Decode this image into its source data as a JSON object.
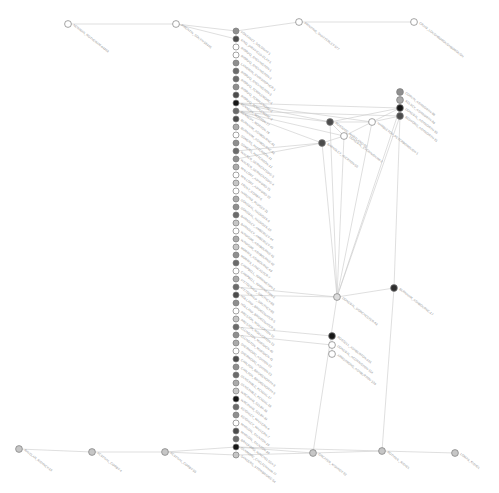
{
  "figure": {
    "title": "",
    "type": "network-graph",
    "width": 499,
    "height": 493,
    "background": "#ffffff"
  },
  "style": {
    "edge_color": "#c9c9c9",
    "node_stroke": "#7d7d7d",
    "label_color": "#8b8b8b",
    "label_angle_deg": 38,
    "node_radius": 3.0,
    "hub_radius": 3.4
  },
  "palette": {
    "black": "#171717",
    "darkest": "#2e2e2e",
    "dark": "#4c4c4c",
    "mid_dark": "#6b6b6b",
    "mid": "#8f8f8f",
    "mid_light": "#ababab",
    "light": "#c6c6c6",
    "lighter": "#dcdcdc",
    "white": "#ffffff"
  },
  "graph_data": {
    "nodes": [
      {
        "id": "n_top_1",
        "label": "NEWMAN_ROTHERAM-64303",
        "x": 68,
        "y": 24,
        "fill": "#ffffff"
      },
      {
        "id": "n_top_2",
        "label": "FIRENTIN_SOUTH-59445",
        "x": 176,
        "y": 24,
        "fill": "#ffffff"
      },
      {
        "id": "n_top_3",
        "label": "PRINTING_SHATTERLEY-577",
        "x": 299,
        "y": 22,
        "fill": "#ffffff"
      },
      {
        "id": "n_top_4",
        "label": "CRAIG_LOUGHBOROUGHBOROUGH",
        "x": 414,
        "y": 22,
        "fill": "#ffffff"
      },
      {
        "id": "c01",
        "label": "FONTANET_SOLOWAY-1",
        "x": 236,
        "y": 31,
        "fill": "#8f8f8f"
      },
      {
        "id": "c02",
        "label": "KING_DRIFFIELD-CLAY-1",
        "x": 236,
        "y": 39,
        "fill": "#4c4c4c"
      },
      {
        "id": "c03",
        "label": "RIORDO_SHEVINGTON-1",
        "x": 236,
        "y": 47,
        "fill": "#ffffff"
      },
      {
        "id": "c04",
        "label": "RIORDO_SHEVINGTON-2",
        "x": 236,
        "y": 55,
        "fill": "#ffffff"
      },
      {
        "id": "c05",
        "label": "LANGMAN_CHRISTOPHER-1",
        "x": 236,
        "y": 63,
        "fill": "#8f8f8f"
      },
      {
        "id": "c06",
        "label": "RIORDO_SHEVINGTON-3",
        "x": 236,
        "y": 71,
        "fill": "#6b6b6b"
      },
      {
        "id": "c07",
        "label": "RIORDO_TEMPLEMORE-1",
        "x": 236,
        "y": 79,
        "fill": "#6b6b6b"
      },
      {
        "id": "c08",
        "label": "RIORDO_TEMPLEMORE-2",
        "x": 236,
        "y": 87,
        "fill": "#8f8f8f"
      },
      {
        "id": "c09",
        "label": "RIORDO_TEMPLEMORE-3",
        "x": 236,
        "y": 95,
        "fill": "#4c4c4c"
      },
      {
        "id": "c10",
        "label": "KENNEDY_MORTON-77",
        "x": 236,
        "y": 103,
        "fill": "#171717"
      },
      {
        "id": "c11",
        "label": "KENNEDY_MORTON-78",
        "x": 236,
        "y": 111,
        "fill": "#6b6b6b"
      },
      {
        "id": "c12",
        "label": "BURNHAM_ASHBOURNE-91",
        "x": 236,
        "y": 119,
        "fill": "#4c4c4c"
      },
      {
        "id": "c13",
        "label": "BURNHAM_ASHBOURNE-92",
        "x": 236,
        "y": 127,
        "fill": "#ababab"
      },
      {
        "id": "c14",
        "label": "SOMERS_PATTERSON-11",
        "x": 236,
        "y": 135,
        "fill": "#ffffff"
      },
      {
        "id": "c15",
        "label": "SOMERS_PATTERSON-12",
        "x": 236,
        "y": 143,
        "fill": "#8f8f8f"
      },
      {
        "id": "c16",
        "label": "WALKER_DERWENTSIDE-3",
        "x": 236,
        "y": 151,
        "fill": "#6b6b6b"
      },
      {
        "id": "c17",
        "label": "WALKER_DERWENTSIDE-4",
        "x": 236,
        "y": 159,
        "fill": "#8f8f8f"
      },
      {
        "id": "c18",
        "label": "MALLORY_ASHFORD-21",
        "x": 236,
        "y": 167,
        "fill": "#ababab"
      },
      {
        "id": "c19",
        "label": "MALLORY_ASHFORD-22",
        "x": 236,
        "y": 175,
        "fill": "#ffffff"
      },
      {
        "id": "c20",
        "label": "TRENT_CORBY-5",
        "x": 236,
        "y": 183,
        "fill": "#c6c6c6"
      },
      {
        "id": "c21",
        "label": "HARDING_PUDSEY-31",
        "x": 236,
        "y": 191,
        "fill": "#ffffff"
      },
      {
        "id": "c22",
        "label": "DONEGAL_HADDOCK-9",
        "x": 236,
        "y": 199,
        "fill": "#ababab"
      },
      {
        "id": "c23",
        "label": "DONEGAL_HADDOCK-10",
        "x": 236,
        "y": 207,
        "fill": "#8f8f8f"
      },
      {
        "id": "c24",
        "label": "BARNSLEY_AMBERLEY-44",
        "x": 236,
        "y": 215,
        "fill": "#6b6b6b"
      },
      {
        "id": "c25",
        "label": "BARNSLEY_AMBERLEY-45",
        "x": 236,
        "y": 223,
        "fill": "#c6c6c6"
      },
      {
        "id": "c26",
        "label": "WINDSOR_ASHBOURNE-61",
        "x": 236,
        "y": 231,
        "fill": "#ffffff"
      },
      {
        "id": "c27",
        "label": "WINDSOR_ASHBOURNE-62",
        "x": 236,
        "y": 239,
        "fill": "#ababab"
      },
      {
        "id": "c28",
        "label": "MORRIS_ASHBOURNE-63",
        "x": 236,
        "y": 247,
        "fill": "#c6c6c6"
      },
      {
        "id": "c29",
        "label": "MORRIS_LANCASTER-7",
        "x": 236,
        "y": 255,
        "fill": "#8f8f8f"
      },
      {
        "id": "c30",
        "label": "CAMPBELL_TORRINGTON-1",
        "x": 236,
        "y": 263,
        "fill": "#6b6b6b"
      },
      {
        "id": "c31",
        "label": "CAMPBELL_TORRINGTON-2",
        "x": 236,
        "y": 271,
        "fill": "#ffffff"
      },
      {
        "id": "c32",
        "label": "FITZGERALD_SOUTHEY-88",
        "x": 236,
        "y": 279,
        "fill": "#ababab"
      },
      {
        "id": "c33",
        "label": "FITZGERALD_SOUTHEY-89",
        "x": 236,
        "y": 287,
        "fill": "#6b6b6b"
      },
      {
        "id": "c34",
        "label": "HOLLAND_BRIDGEWATER-5",
        "x": 236,
        "y": 295,
        "fill": "#4c4c4c"
      },
      {
        "id": "c35",
        "label": "HOLLAND_BRIDGEWATER-6",
        "x": 236,
        "y": 303,
        "fill": "#8f8f8f"
      },
      {
        "id": "c36",
        "label": "PRESTON_WOLVERTON-12",
        "x": 236,
        "y": 311,
        "fill": "#ffffff"
      },
      {
        "id": "c37",
        "label": "PRESTON_WOLVERTON-13",
        "x": 236,
        "y": 319,
        "fill": "#c6c6c6"
      },
      {
        "id": "c38",
        "label": "ELLINGTON_MARSDEN-40",
        "x": 236,
        "y": 327,
        "fill": "#6b6b6b"
      },
      {
        "id": "c39",
        "label": "ELLINGTON_MARSDEN-41",
        "x": 236,
        "y": 335,
        "fill": "#8f8f8f"
      },
      {
        "id": "c40",
        "label": "SHERWOOD_ASHTON-22",
        "x": 236,
        "y": 343,
        "fill": "#ababab"
      },
      {
        "id": "c41",
        "label": "SHERWOOD_ASHTON-23",
        "x": 236,
        "y": 351,
        "fill": "#ffffff"
      },
      {
        "id": "c42",
        "label": "CARLTON_BRIDGENORTH-8",
        "x": 236,
        "y": 359,
        "fill": "#4c4c4c"
      },
      {
        "id": "c43",
        "label": "CARLTON_BRIDGENORTH-9",
        "x": 236,
        "y": 367,
        "fill": "#8f8f8f"
      },
      {
        "id": "c44",
        "label": "DUNSTABLE_KENDAL-17",
        "x": 236,
        "y": 375,
        "fill": "#6b6b6b"
      },
      {
        "id": "c45",
        "label": "DUNSTABLE_KENDAL-18",
        "x": 236,
        "y": 383,
        "fill": "#ababab"
      },
      {
        "id": "c46",
        "label": "WREXHAM_SELBY-33",
        "x": 236,
        "y": 391,
        "fill": "#c6c6c6"
      },
      {
        "id": "c47",
        "label": "WREXHAM_SELBY-34",
        "x": 236,
        "y": 399,
        "fill": "#171717"
      },
      {
        "id": "c48",
        "label": "KEIGHLEY_MALVERN-6",
        "x": 236,
        "y": 407,
        "fill": "#6b6b6b"
      },
      {
        "id": "c49",
        "label": "KEIGHLEY_MALVERN-7",
        "x": 236,
        "y": 415,
        "fill": "#8f8f8f"
      },
      {
        "id": "c50",
        "label": "MARLOW_TAUNTON-29",
        "x": 236,
        "y": 423,
        "fill": "#ffffff"
      },
      {
        "id": "c51",
        "label": "MARLOW_TAUNTON-30",
        "x": 236,
        "y": 431,
        "fill": "#4c4c4c"
      },
      {
        "id": "c52",
        "label": "BRADFORD_WINCHELSEA-2",
        "x": 236,
        "y": 439,
        "fill": "#6b6b6b"
      },
      {
        "id": "c53",
        "label": "DUNMORE_CHELTENHAM-77",
        "x": 236,
        "y": 447,
        "fill": "#171717"
      },
      {
        "id": "c54",
        "label": "SANDERS_STOWBRIDGE-54",
        "x": 236,
        "y": 455,
        "fill": "#c6c6c6"
      },
      {
        "id": "r_a",
        "label": "CORVIN_ASHWORTH-88",
        "x": 400,
        "y": 92,
        "fill": "#8f8f8f"
      },
      {
        "id": "r_b",
        "label": "KELSEY_ASHWORTH-89",
        "x": 400,
        "y": 100,
        "fill": "#ababab"
      },
      {
        "id": "r_c",
        "label": "DONEGAL_ASHWORTH-90",
        "x": 400,
        "y": 108,
        "fill": "#171717"
      },
      {
        "id": "r_d",
        "label": "BEDFORD_ASHWORTH-91",
        "x": 400,
        "y": 116,
        "fill": "#4c4c4c"
      },
      {
        "id": "r_e",
        "label": "ROSSCOE_MARTLAND-55",
        "x": 330,
        "y": 122,
        "fill": "#4c4c4c"
      },
      {
        "id": "r_f",
        "label": "HAMBLETON_PETERBOROUGH-1",
        "x": 372,
        "y": 122,
        "fill": "#ffffff"
      },
      {
        "id": "r_g",
        "label": "DONEGAL_EVERINGHAM-2",
        "x": 344,
        "y": 136,
        "fill": "#ffffff"
      },
      {
        "id": "r_h",
        "label": "BARNSLEY_AVERTON-50",
        "x": 322,
        "y": 143,
        "fill": "#4c4c4c"
      },
      {
        "id": "r_i",
        "label": "DONEGAL_DORCHESTER-63",
        "x": 337,
        "y": 297,
        "fill": "#dcdcdc"
      },
      {
        "id": "r_j",
        "label": "BURNHAM_ASHBOURNE-17",
        "x": 394,
        "y": 288,
        "fill": "#2e2e2e"
      },
      {
        "id": "s_a",
        "label": "ROSSELL_ASHBURTON-101",
        "x": 332,
        "y": 336,
        "fill": "#171717"
      },
      {
        "id": "s_b",
        "label": "DONEGAL_ACCRINGTON-114",
        "x": 332,
        "y": 345,
        "fill": "#ffffff"
      },
      {
        "id": "s_c",
        "label": "ARMSTRONG_ASHBURTON-120",
        "x": 332,
        "y": 354,
        "fill": "#ffffff"
      },
      {
        "id": "n_bot_1",
        "label": "RAVELAR_KISHNEY-19",
        "x": 19,
        "y": 449,
        "fill": "#c6c6c6"
      },
      {
        "id": "n_bot_2",
        "label": "FESTIVAL_CORBY-4",
        "x": 92,
        "y": 452,
        "fill": "#c6c6c6"
      },
      {
        "id": "n_bot_3",
        "label": "FESTIVAL_CORBY-55",
        "x": 165,
        "y": 452,
        "fill": "#c6c6c6"
      },
      {
        "id": "n_bot_4",
        "label": "GREATER_KISHNEY-92",
        "x": 313,
        "y": 453,
        "fill": "#c6c6c6"
      },
      {
        "id": "n_bot_5",
        "label": "ROTHWIL_KISHEL",
        "x": 382,
        "y": 451,
        "fill": "#c6c6c6"
      },
      {
        "id": "n_bot_6",
        "label": "LOMAS_KISHEL",
        "x": 455,
        "y": 453,
        "fill": "#c6c6c6"
      }
    ],
    "edges": [
      [
        "n_top_1",
        "n_top_2"
      ],
      [
        "n_top_2",
        "c01"
      ],
      [
        "c01",
        "n_top_3"
      ],
      [
        "n_top_3",
        "n_top_4"
      ],
      [
        "n_top_2",
        "c02"
      ],
      [
        "c01",
        "c02"
      ],
      [
        "c10",
        "r_e"
      ],
      [
        "c10",
        "r_f"
      ],
      [
        "c11",
        "r_e"
      ],
      [
        "c11",
        "r_h"
      ],
      [
        "c11",
        "r_g"
      ],
      [
        "c10",
        "r_c"
      ],
      [
        "c11",
        "r_d"
      ],
      [
        "r_e",
        "r_f"
      ],
      [
        "r_e",
        "r_g"
      ],
      [
        "r_f",
        "r_g"
      ],
      [
        "r_g",
        "r_h"
      ],
      [
        "r_e",
        "r_c"
      ],
      [
        "r_f",
        "r_c"
      ],
      [
        "r_f",
        "r_d"
      ],
      [
        "r_c",
        "r_d"
      ],
      [
        "r_c",
        "r_b"
      ],
      [
        "r_a",
        "r_b"
      ],
      [
        "r_b",
        "r_c"
      ],
      [
        "r_e",
        "r_i"
      ],
      [
        "r_f",
        "r_i"
      ],
      [
        "r_g",
        "r_i"
      ],
      [
        "r_h",
        "r_i"
      ],
      [
        "r_d",
        "r_i"
      ],
      [
        "r_c",
        "r_i"
      ],
      [
        "r_i",
        "r_j"
      ],
      [
        "r_d",
        "r_j"
      ],
      [
        "r_i",
        "c33"
      ],
      [
        "r_i",
        "c34"
      ],
      [
        "r_h",
        "c16"
      ],
      [
        "r_h",
        "c17"
      ],
      [
        "s_a",
        "c38"
      ],
      [
        "s_b",
        "c39"
      ],
      [
        "s_a",
        "s_b"
      ],
      [
        "s_b",
        "s_c"
      ],
      [
        "n_bot_1",
        "n_bot_2"
      ],
      [
        "n_bot_2",
        "n_bot_3"
      ],
      [
        "n_bot_3",
        "c53"
      ],
      [
        "c53",
        "n_bot_4"
      ],
      [
        "n_bot_4",
        "n_bot_5"
      ],
      [
        "n_bot_5",
        "n_bot_6"
      ],
      [
        "c54",
        "n_bot_3"
      ],
      [
        "c54",
        "n_bot_4"
      ],
      [
        "c53",
        "n_bot_5"
      ],
      [
        "r_i",
        "n_bot_4"
      ],
      [
        "r_j",
        "n_bot_5"
      ]
    ]
  }
}
